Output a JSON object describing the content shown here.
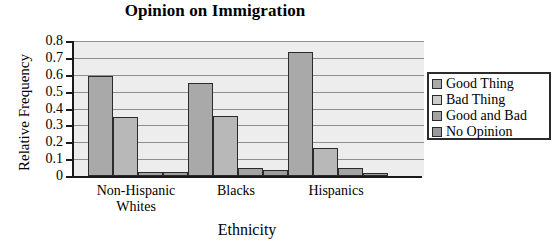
{
  "chart_data": {
    "type": "bar",
    "title": "Opinion on Immigration",
    "xlabel": "Ethnicity",
    "ylabel": "Relative Frequency",
    "categories": [
      "Non-Hispanic\nWhites",
      "Blacks",
      "Hispanics"
    ],
    "series": [
      {
        "name": "Good Thing",
        "values": [
          0.59,
          0.55,
          0.735
        ]
      },
      {
        "name": "Bad Thing",
        "values": [
          0.35,
          0.355,
          0.165
        ]
      },
      {
        "name": "Good and Bad",
        "values": [
          0.025,
          0.045,
          0.05
        ]
      },
      {
        "name": "No Opinion",
        "values": [
          0.025,
          0.035,
          0.015
        ]
      }
    ],
    "ylim": [
      0,
      0.8
    ],
    "yticks": [
      "0",
      "0.1",
      "0.2",
      "0.3",
      "0.4",
      "0.5",
      "0.6",
      "0.7",
      "0.8"
    ],
    "ytick_values": [
      0,
      0.1,
      0.2,
      0.3,
      0.4,
      0.5,
      0.6,
      0.7,
      0.8
    ],
    "grid": true,
    "legend_position": "right",
    "plot_background": "#ededed",
    "bar_color": "#a9a9a9",
    "gridline_color": "#8f8f8f",
    "axis_color": "#1a1a1a"
  }
}
